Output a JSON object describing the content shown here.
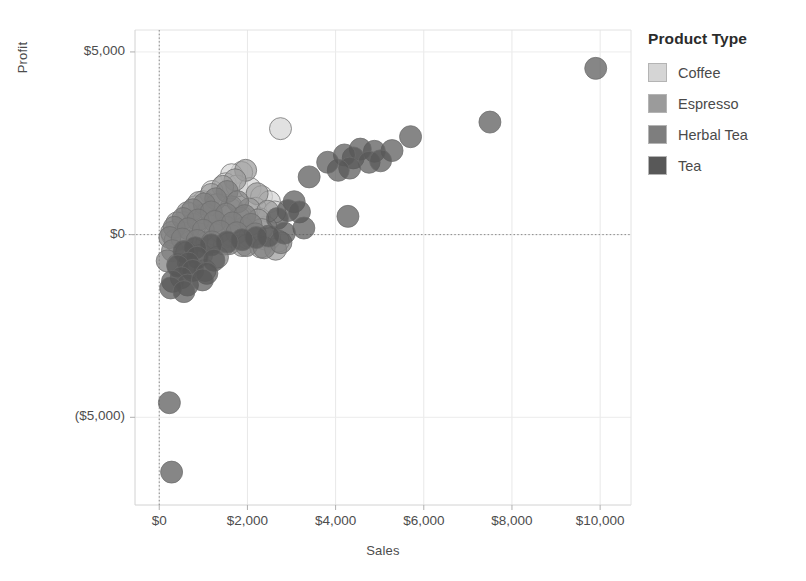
{
  "chart_data": {
    "type": "scatter",
    "title": "",
    "xlabel": "Sales",
    "ylabel": "Profit",
    "xlim": [
      -550,
      10700
    ],
    "ylim": [
      -7400,
      5600
    ],
    "xticks": [
      0,
      2000,
      4000,
      6000,
      8000,
      10000
    ],
    "xtick_labels": [
      "$0",
      "$2,000",
      "$4,000",
      "$6,000",
      "$8,000",
      "$10,000"
    ],
    "yticks": [
      5000,
      0,
      -5000
    ],
    "ytick_labels": [
      "$5,000",
      "$0",
      "($5,000)"
    ],
    "grid": true,
    "reference_lines": [
      {
        "axis": "x",
        "value": 0,
        "style": "dotted"
      },
      {
        "axis": "y",
        "value": 0,
        "style": "dotted"
      }
    ],
    "legend": {
      "title": "Product Type",
      "position": "right",
      "entries": [
        {
          "name": "Coffee",
          "color": "#d5d5d5"
        },
        {
          "name": "Espresso",
          "color": "#9b9b9b"
        },
        {
          "name": "Herbal Tea",
          "color": "#7e7e7e"
        },
        {
          "name": "Tea",
          "color": "#585858"
        }
      ]
    },
    "marker": {
      "shape": "circle",
      "radius": 11,
      "opacity": 0.72,
      "stroke": "#6e6e6e"
    },
    "series": [
      {
        "name": "Coffee",
        "color": "#d5d5d5",
        "points": [
          [
            2750,
            2900
          ],
          [
            1870,
            1700
          ],
          [
            1640,
            1640
          ],
          [
            1500,
            1390
          ],
          [
            1760,
            1330
          ],
          [
            1200,
            1180
          ],
          [
            2060,
            1260
          ],
          [
            2320,
            1040
          ],
          [
            2500,
            900
          ],
          [
            1000,
            900
          ],
          [
            820,
            760
          ],
          [
            1340,
            820
          ],
          [
            1620,
            700
          ],
          [
            2180,
            720
          ],
          [
            2620,
            620
          ],
          [
            680,
            560
          ],
          [
            980,
            540
          ],
          [
            1420,
            520
          ],
          [
            1880,
            470
          ],
          [
            2280,
            430
          ],
          [
            540,
            330
          ],
          [
            860,
            300
          ],
          [
            1180,
            280
          ],
          [
            1560,
            250
          ],
          [
            1980,
            230
          ],
          [
            2420,
            200
          ],
          [
            420,
            130
          ],
          [
            700,
            110
          ],
          [
            1020,
            90
          ],
          [
            1340,
            70
          ],
          [
            1700,
            60
          ],
          [
            2080,
            40
          ],
          [
            300,
            -20
          ],
          [
            600,
            -30
          ],
          [
            900,
            -40
          ],
          [
            1240,
            -50
          ],
          [
            1600,
            -60
          ],
          [
            2000,
            -90
          ],
          [
            2400,
            -120
          ],
          [
            2700,
            -180
          ]
        ]
      },
      {
        "name": "Espresso",
        "color": "#9b9b9b",
        "points": [
          [
            1960,
            1760
          ],
          [
            1720,
            1500
          ],
          [
            1440,
            1320
          ],
          [
            1180,
            1100
          ],
          [
            2220,
            1120
          ],
          [
            900,
            880
          ],
          [
            1300,
            820
          ],
          [
            1640,
            760
          ],
          [
            2040,
            700
          ],
          [
            2460,
            640
          ],
          [
            640,
            600
          ],
          [
            1060,
            560
          ],
          [
            1480,
            500
          ],
          [
            1820,
            450
          ],
          [
            2240,
            400
          ],
          [
            400,
            320
          ],
          [
            760,
            280
          ],
          [
            1140,
            240
          ],
          [
            1520,
            200
          ],
          [
            1900,
            170
          ],
          [
            2320,
            140
          ],
          [
            280,
            60
          ],
          [
            580,
            40
          ],
          [
            920,
            20
          ],
          [
            1260,
            0
          ],
          [
            1640,
            -30
          ],
          [
            2060,
            -60
          ],
          [
            2500,
            -110
          ],
          [
            360,
            -160
          ],
          [
            720,
            -190
          ],
          [
            1080,
            -220
          ],
          [
            1480,
            -260
          ],
          [
            1880,
            -300
          ],
          [
            2300,
            -340
          ],
          [
            2640,
            -400
          ]
        ]
      },
      {
        "name": "Herbal Tea",
        "color": "#7e7e7e",
        "points": [
          [
            1540,
            1180
          ],
          [
            1280,
            980
          ],
          [
            1020,
            840
          ],
          [
            1780,
            900
          ],
          [
            760,
            680
          ],
          [
            1180,
            620
          ],
          [
            1520,
            560
          ],
          [
            1940,
            520
          ],
          [
            540,
            440
          ],
          [
            880,
            400
          ],
          [
            1260,
            360
          ],
          [
            1660,
            320
          ],
          [
            2080,
            280
          ],
          [
            340,
            200
          ],
          [
            660,
            160
          ],
          [
            1000,
            120
          ],
          [
            1380,
            90
          ],
          [
            1760,
            50
          ],
          [
            2180,
            20
          ],
          [
            240,
            -80
          ],
          [
            520,
            -120
          ],
          [
            860,
            -160
          ],
          [
            1200,
            -200
          ],
          [
            1580,
            -250
          ],
          [
            1980,
            -300
          ],
          [
            2380,
            -360
          ],
          [
            300,
            -440
          ],
          [
            620,
            -500
          ],
          [
            960,
            -560
          ],
          [
            1320,
            -620
          ],
          [
            180,
            -720
          ],
          [
            420,
            -820
          ],
          [
            700,
            -900
          ],
          [
            1040,
            -980
          ],
          [
            2760,
            -220
          ]
        ]
      },
      {
        "name": "Tea",
        "color": "#585858",
        "points": [
          [
            9900,
            4550
          ],
          [
            7500,
            3080
          ],
          [
            5700,
            2680
          ],
          [
            5280,
            2300
          ],
          [
            4880,
            2280
          ],
          [
            4560,
            2340
          ],
          [
            4400,
            2100
          ],
          [
            4200,
            2180
          ],
          [
            4760,
            1980
          ],
          [
            5020,
            2020
          ],
          [
            4320,
            1820
          ],
          [
            4060,
            1760
          ],
          [
            3820,
            1980
          ],
          [
            3400,
            1580
          ],
          [
            4280,
            500
          ],
          [
            3060,
            900
          ],
          [
            2920,
            660
          ],
          [
            3180,
            620
          ],
          [
            2680,
            440
          ],
          [
            3280,
            180
          ],
          [
            2840,
            40
          ],
          [
            2480,
            -40
          ],
          [
            2200,
            -80
          ],
          [
            1880,
            -140
          ],
          [
            1540,
            -200
          ],
          [
            1180,
            -280
          ],
          [
            820,
            -360
          ],
          [
            560,
            -460
          ],
          [
            860,
            -620
          ],
          [
            1240,
            -700
          ],
          [
            660,
            -780
          ],
          [
            420,
            -860
          ],
          [
            760,
            -980
          ],
          [
            1080,
            -1060
          ],
          [
            500,
            -1180
          ],
          [
            300,
            -1280
          ],
          [
            640,
            -1380
          ],
          [
            980,
            -1240
          ],
          [
            260,
            -1460
          ],
          [
            560,
            -1560
          ],
          [
            230,
            -4600
          ],
          [
            280,
            -6500
          ]
        ]
      }
    ]
  }
}
